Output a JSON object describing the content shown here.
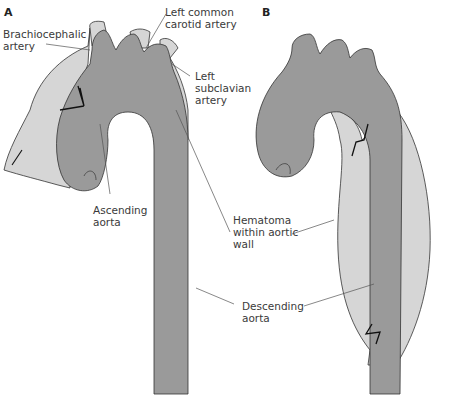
{
  "panels": [
    {
      "id": "A",
      "label": "A"
    },
    {
      "id": "B",
      "label": "B"
    }
  ],
  "labels": {
    "brachiocephalic": "Brachiocephalic\nartery",
    "left_common_carotid": "Left common\ncarotid artery",
    "left_subclavian": "Left\nsubclavian\nartery",
    "ascending_aorta": "Ascending\naorta",
    "hematoma": "Hematoma\nwithin aortic\nwall",
    "descending_aorta": "Descending\naorta"
  },
  "colors": {
    "aorta": "#9a9a9a",
    "hematoma": "#d6d6d6",
    "outline": "#333333",
    "leader": "#555555",
    "background": "#ffffff"
  }
}
